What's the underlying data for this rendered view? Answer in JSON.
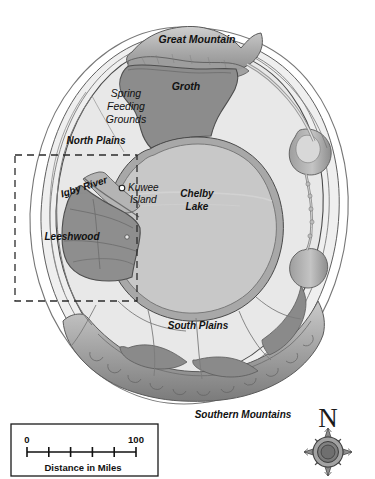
{
  "map": {
    "title": "Island Map",
    "regions": [
      {
        "id": "great-mountain",
        "label": "Great Mountain",
        "type": "mountain",
        "style": "bold-italic",
        "color": "#9a9a9a"
      },
      {
        "id": "groth",
        "label": "Groth",
        "type": "territory",
        "style": "bold-italic",
        "color": "#8c8c8c"
      },
      {
        "id": "spring-feeding-grounds",
        "label": "Spring Feeding Grounds",
        "type": "grounds",
        "style": "italic",
        "color": "#e6e6e6"
      },
      {
        "id": "north-plains",
        "label": "North Plains",
        "type": "plains",
        "style": "bold-italic",
        "color": "#e8e8e8"
      },
      {
        "id": "igby-river",
        "label": "Igby River",
        "type": "river",
        "style": "bold-italic",
        "color": "#b4b4b4"
      },
      {
        "id": "kuwee-island",
        "label": "Kuwee Island",
        "type": "island",
        "style": "italic",
        "color": "#c9c9c9"
      },
      {
        "id": "chelby-lake",
        "label": "Chelby Lake",
        "type": "lake",
        "style": "bold-italic",
        "color": "#c8c8c8"
      },
      {
        "id": "leeshwood",
        "label": "Leeshwood",
        "type": "forest",
        "style": "bold-italic",
        "color": "#8e8e8e"
      },
      {
        "id": "south-plains",
        "label": "South Plains",
        "type": "plains",
        "style": "bold-italic",
        "color": "#e8e8e8"
      },
      {
        "id": "southern-mountains",
        "label": "Southern Mountains",
        "type": "mountain",
        "style": "bold-italic",
        "color": "#8a8a8a"
      }
    ],
    "labels": {
      "great_mountain": "Great Mountain",
      "groth": "Groth",
      "spring_feeding_grounds_line1": "Spring",
      "spring_feeding_grounds_line2": "Feeding",
      "spring_feeding_grounds_line3": "Grounds",
      "north_plains": "North Plains",
      "igby_river": "Igby River",
      "kuwee_island_line1": "Kuwee",
      "kuwee_island_line2": "Island",
      "chelby_lake_line1": "Chelby",
      "chelby_lake_line2": "Lake",
      "leeshwood": "Leeshwood",
      "south_plains": "South Plains",
      "southern_mountains": "Southern Mountains"
    },
    "markers": [
      {
        "id": "kuwee-island-marker",
        "label": "Kuwee Island",
        "shape": "circle-open"
      },
      {
        "id": "small-islet-marker",
        "label": "",
        "shape": "circle-open"
      }
    ],
    "inset": {
      "name": "detail-area",
      "style": "dashed-rectangle",
      "stroke_color": "#2b2b2b"
    },
    "scale_bar": {
      "min_label": "0",
      "max_label": "100",
      "caption": "Distance in Miles",
      "units": "miles",
      "tick_count": 6,
      "min_value": 0,
      "max_value": 100
    },
    "compass": {
      "north_label": "N",
      "points": 8
    },
    "palette": {
      "background": "#ffffff",
      "plains": "#e8e8e8",
      "lake": "#c8c8c8",
      "dark_region": "#8c8c8c",
      "mountain_light": "#b9b9b9",
      "mountain_mid": "#9c9c9c",
      "mountain_dark": "#7e7e7e",
      "coast_band": "#efefef",
      "outline": "#3a3a3a",
      "text": "#111111"
    }
  }
}
